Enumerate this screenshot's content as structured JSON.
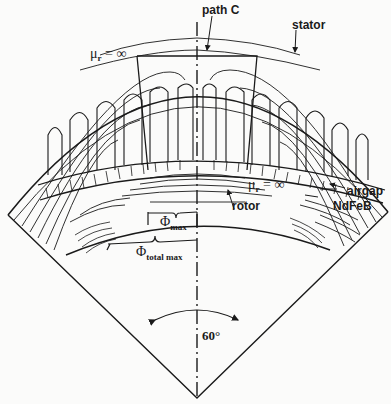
{
  "diagram": {
    "type": "cross-section of permanent magnet machine sector with magnetic flux lines",
    "labels": {
      "path_c": "path C",
      "stator": "stator",
      "mu_top": "μr = ∞",
      "mu_top_symbol": "μ",
      "mu_top_sub": "r",
      "mu_top_rest": " = ∞",
      "mu_rotor_symbol": "μ",
      "mu_rotor_sub": "r",
      "mu_rotor_rest": " = ∞",
      "airgap": "airgap",
      "ndfeb": "NdFeB",
      "rotor": "rotor",
      "phi_max_symbol": "Φ",
      "phi_max_sub": "max",
      "phi_total_symbol": "Φ",
      "phi_total_sub": "total max",
      "angle": "60°"
    },
    "colors": {
      "line": "#1a1a1a",
      "background": "#fbfbfa"
    }
  }
}
